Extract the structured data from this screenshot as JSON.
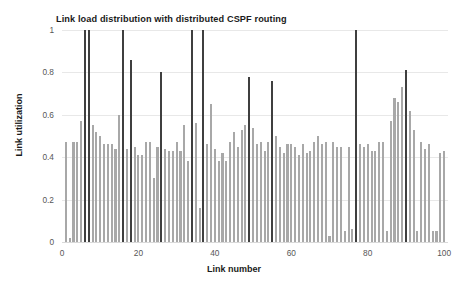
{
  "chart_data": {
    "type": "bar",
    "title": "Link load distribution with distributed CSPF routing",
    "xlabel": "Link number",
    "ylabel": "Link utilization",
    "xlim": [
      0,
      101
    ],
    "ylim": [
      0,
      1
    ],
    "grid": true,
    "legend": false,
    "xticks": [
      "0",
      "20",
      "40",
      "60",
      "80",
      "100"
    ],
    "xtick_values": [
      0,
      20,
      40,
      60,
      80,
      100
    ],
    "yticks": [
      "0",
      "0.2",
      "0.4",
      "0.6",
      "0.8",
      "1"
    ],
    "ytick_values": [
      0,
      0.2,
      0.4,
      0.6,
      0.8,
      1
    ],
    "colors": {
      "bar_light": "#a8a8a8",
      "bar_dark": "#3f3f3f",
      "gridline": "#e8e8e8",
      "text": "#1a1a1a",
      "tick_text": "#565656",
      "background": "#ffffff"
    },
    "highlight_threshold": 0.75,
    "categories": [
      1,
      2,
      3,
      4,
      5,
      6,
      7,
      8,
      9,
      10,
      11,
      12,
      13,
      14,
      15,
      16,
      17,
      18,
      19,
      20,
      21,
      22,
      23,
      24,
      25,
      26,
      27,
      28,
      29,
      30,
      31,
      32,
      33,
      34,
      35,
      36,
      37,
      38,
      39,
      40,
      41,
      42,
      43,
      44,
      45,
      46,
      47,
      48,
      49,
      50,
      51,
      52,
      53,
      54,
      55,
      56,
      57,
      58,
      59,
      60,
      61,
      62,
      63,
      64,
      65,
      66,
      67,
      68,
      69,
      70,
      71,
      72,
      73,
      74,
      75,
      76,
      77,
      78,
      79,
      80,
      81,
      82,
      83,
      84,
      85,
      86,
      87,
      88,
      89,
      90,
      91,
      92,
      93,
      94,
      95,
      96,
      97,
      98,
      99,
      100
    ],
    "values": [
      0.47,
      0.02,
      0.47,
      0.47,
      0.57,
      1.0,
      1.0,
      0.55,
      0.52,
      0.5,
      0.46,
      0.46,
      0.46,
      0.44,
      0.6,
      1.0,
      0.44,
      0.86,
      0.45,
      0.41,
      0.41,
      0.47,
      0.47,
      0.3,
      0.45,
      0.8,
      0.44,
      0.43,
      0.43,
      0.47,
      0.43,
      0.55,
      0.38,
      1.0,
      0.56,
      0.16,
      1.0,
      0.46,
      0.65,
      0.44,
      0.38,
      0.42,
      0.38,
      0.47,
      0.52,
      0.45,
      0.53,
      0.55,
      0.78,
      0.54,
      0.46,
      0.47,
      0.43,
      0.47,
      0.76,
      0.5,
      0.45,
      0.42,
      0.46,
      0.46,
      0.45,
      0.41,
      0.46,
      0.42,
      0.43,
      0.47,
      0.5,
      0.46,
      0.47,
      0.03,
      0.47,
      0.45,
      0.45,
      0.05,
      0.45,
      0.06,
      1.0,
      0.46,
      0.45,
      0.46,
      0.43,
      0.43,
      0.47,
      0.47,
      0.05,
      0.57,
      0.68,
      0.66,
      0.73,
      0.81,
      0.62,
      0.53,
      0.05,
      0.47,
      0.44,
      0.46,
      0.05,
      0.05,
      0.42,
      0.43
    ]
  }
}
